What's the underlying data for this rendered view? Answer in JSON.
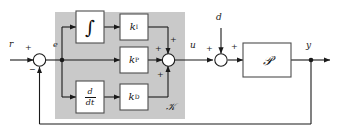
{
  "diagram": {
    "colors": {
      "line": "#1a1a1a",
      "block_fill": "#ffffff",
      "block_stroke": "#4d4d4d",
      "region_fill": "#c9c9c9",
      "background": "#ffffff"
    },
    "signals": {
      "reference": "r",
      "error": "e",
      "control": "u",
      "disturbance": "d",
      "output": "y"
    },
    "signs": {
      "ref_plus": "+",
      "feedback_minus": "−",
      "sum_integral_plus": "+",
      "sum_prop_plus": "+",
      "sum_deriv_plus": "+",
      "dist_left_plus": "+",
      "dist_right_plus": "+"
    },
    "blocks": [
      {
        "id": "integrator",
        "label": "∫",
        "kind": "operator"
      },
      {
        "id": "gain-ki",
        "label": "k",
        "sub": "I",
        "kind": "gain"
      },
      {
        "id": "gain-kp",
        "label": "k",
        "sub": "P",
        "kind": "gain"
      },
      {
        "id": "differentiator",
        "num": "d",
        "den": "dt",
        "kind": "operator"
      },
      {
        "id": "gain-kd",
        "label": "k",
        "sub": "D",
        "kind": "gain"
      },
      {
        "id": "plant",
        "label": "𝒫",
        "kind": "plant"
      }
    ],
    "regions": [
      {
        "id": "controller",
        "label": "𝒦"
      }
    ]
  }
}
